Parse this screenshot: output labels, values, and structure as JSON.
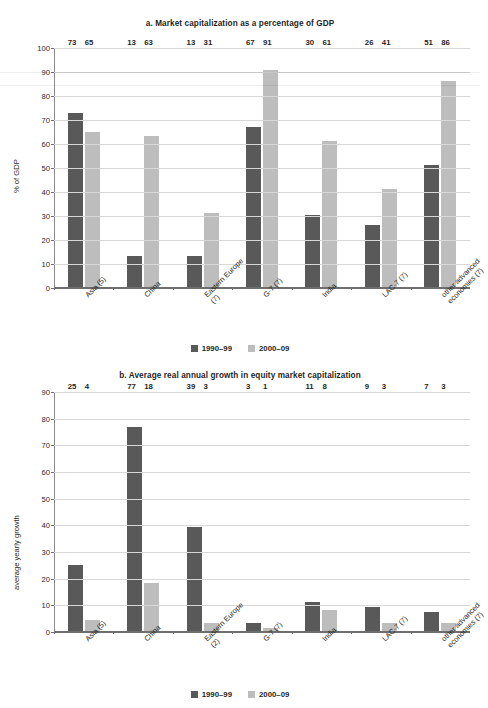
{
  "legend": {
    "series": [
      {
        "label": "1990–99",
        "color": "#595959"
      },
      {
        "label": "2000–09",
        "color": "#bdbdbd"
      }
    ]
  },
  "chart_data": [
    {
      "id": "a",
      "type": "bar",
      "title": "a. Market capitalization as a percentage of GDP",
      "xlabel": "",
      "ylabel": "% of GDP",
      "ylim": [
        0,
        100
      ],
      "ytick_step": 10,
      "yticks": [
        "100",
        "90",
        "80",
        "70",
        "60",
        "50",
        "40",
        "30",
        "20",
        "10",
        "0"
      ],
      "grid": true,
      "legend_position": "bottom",
      "categories": [
        "Asia (5)",
        "China",
        "Eastern Europe (7)",
        "G-7 (7)",
        "India",
        "LAC-7 (7)",
        "other advanced economies (7)"
      ],
      "category_lines": [
        [
          "Asia (5)"
        ],
        [
          "China"
        ],
        [
          "Eastern Europe",
          "(7)"
        ],
        [
          "G-7 (7)"
        ],
        [
          "India"
        ],
        [
          "LAC-7 (7)"
        ],
        [
          "other advanced",
          "economies (7)"
        ]
      ],
      "series": [
        {
          "name": "1990–99",
          "color": "#595959",
          "values": [
            73,
            13,
            13,
            67,
            30,
            26,
            51
          ]
        },
        {
          "name": "2000–09",
          "color": "#bdbdbd",
          "values": [
            65,
            63,
            31,
            91,
            61,
            41,
            86
          ]
        }
      ]
    },
    {
      "id": "b",
      "type": "bar",
      "title": "b. Average real annual growth in equity market capitalization",
      "xlabel": "",
      "ylabel": "average yearly growth",
      "ylim": [
        0,
        90
      ],
      "ytick_step": 10,
      "yticks": [
        "90",
        "80",
        "70",
        "60",
        "50",
        "40",
        "30",
        "20",
        "10",
        "0"
      ],
      "grid": true,
      "legend_position": "bottom",
      "categories": [
        "Asia (5)",
        "China",
        "Eastern Europe (2)",
        "G-7 (7)",
        "India",
        "LAC-7 (7)",
        "other advanced economies (7)"
      ],
      "category_lines": [
        [
          "Asia (5)"
        ],
        [
          "China"
        ],
        [
          "Eastern Europe",
          "(2)"
        ],
        [
          "G-7 (7)"
        ],
        [
          "India"
        ],
        [
          "LAC-7 (7)"
        ],
        [
          "other advanced",
          "economies (7)"
        ]
      ],
      "series": [
        {
          "name": "1990–99",
          "color": "#595959",
          "values": [
            25,
            77,
            39,
            3,
            11,
            9,
            7
          ]
        },
        {
          "name": "2000–09",
          "color": "#bdbdbd",
          "values": [
            4,
            18,
            3,
            1,
            8,
            3,
            3
          ]
        }
      ]
    }
  ]
}
